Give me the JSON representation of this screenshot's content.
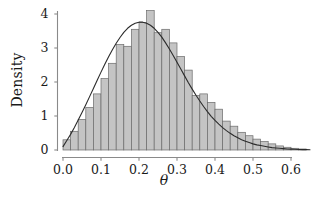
{
  "chart_data": {
    "type": "bar",
    "title": "",
    "subtitle": "",
    "xlabel": "θ",
    "ylabel": "Density",
    "xlim": [
      -0.012,
      0.66
    ],
    "ylim": [
      0,
      4.25
    ],
    "grid": false,
    "legend": null,
    "x_ticks": [
      0.0,
      0.1,
      0.2,
      0.3,
      0.4,
      0.5,
      0.6
    ],
    "x_tick_labels": [
      "0.0",
      "0.1",
      "0.2",
      "0.3",
      "0.4",
      "0.5",
      "0.6"
    ],
    "y_ticks": [
      0,
      1,
      2,
      3,
      4
    ],
    "y_tick_labels": [
      "0",
      "1",
      "2",
      "3",
      "4"
    ],
    "bin_width": 0.02,
    "bin_edges": [
      0.0,
      0.02,
      0.04,
      0.06,
      0.08,
      0.1,
      0.12,
      0.14,
      0.16,
      0.18,
      0.2,
      0.22,
      0.24,
      0.26,
      0.28,
      0.3,
      0.32,
      0.34,
      0.36,
      0.38,
      0.4,
      0.42,
      0.44,
      0.46,
      0.48,
      0.5,
      0.52,
      0.54,
      0.56,
      0.58,
      0.6,
      0.62,
      0.64
    ],
    "categories": [
      "0.00-0.02",
      "0.02-0.04",
      "0.04-0.06",
      "0.06-0.08",
      "0.08-0.10",
      "0.10-0.12",
      "0.12-0.14",
      "0.14-0.16",
      "0.16-0.18",
      "0.18-0.20",
      "0.20-0.22",
      "0.22-0.24",
      "0.24-0.26",
      "0.26-0.28",
      "0.28-0.30",
      "0.30-0.32",
      "0.32-0.34",
      "0.34-0.36",
      "0.36-0.38",
      "0.38-0.40",
      "0.40-0.42",
      "0.42-0.44",
      "0.44-0.46",
      "0.46-0.48",
      "0.48-0.50",
      "0.50-0.52",
      "0.52-0.54",
      "0.54-0.56",
      "0.56-0.58",
      "0.58-0.60",
      "0.60-0.62",
      "0.62-0.64"
    ],
    "values": [
      0.3,
      0.55,
      0.9,
      1.25,
      1.65,
      2.1,
      2.55,
      3.1,
      3.05,
      3.55,
      3.75,
      4.1,
      3.45,
      3.55,
      3.15,
      2.75,
      2.35,
      1.6,
      1.65,
      1.4,
      1.2,
      0.85,
      0.7,
      0.52,
      0.42,
      0.32,
      0.25,
      0.18,
      0.12,
      0.08,
      0.05,
      0.03
    ],
    "series": [
      {
        "name": "density-curve",
        "type": "line",
        "x": [
          0.0,
          0.01,
          0.02,
          0.03,
          0.04,
          0.05,
          0.06,
          0.07,
          0.08,
          0.09,
          0.1,
          0.11,
          0.12,
          0.13,
          0.14,
          0.15,
          0.16,
          0.17,
          0.18,
          0.19,
          0.2,
          0.21,
          0.22,
          0.23,
          0.24,
          0.25,
          0.26,
          0.27,
          0.28,
          0.29,
          0.3,
          0.31,
          0.32,
          0.33,
          0.34,
          0.35,
          0.36,
          0.37,
          0.38,
          0.39,
          0.4,
          0.41,
          0.42,
          0.43,
          0.44,
          0.45,
          0.46,
          0.47,
          0.48,
          0.49,
          0.5,
          0.51,
          0.52,
          0.53,
          0.54,
          0.55,
          0.56,
          0.57,
          0.58,
          0.59,
          0.6,
          0.61,
          0.62,
          0.63,
          0.64,
          0.65
        ],
        "y": [
          0.1,
          0.28,
          0.46,
          0.66,
          0.88,
          1.1,
          1.33,
          1.57,
          1.81,
          2.05,
          2.29,
          2.52,
          2.74,
          2.95,
          3.14,
          3.31,
          3.46,
          3.58,
          3.67,
          3.73,
          3.76,
          3.76,
          3.73,
          3.67,
          3.58,
          3.46,
          3.32,
          3.15,
          2.97,
          2.78,
          2.58,
          2.38,
          2.18,
          1.98,
          1.79,
          1.61,
          1.44,
          1.28,
          1.13,
          0.99,
          0.87,
          0.76,
          0.66,
          0.57,
          0.49,
          0.42,
          0.36,
          0.3,
          0.26,
          0.22,
          0.18,
          0.15,
          0.13,
          0.11,
          0.09,
          0.07,
          0.06,
          0.05,
          0.04,
          0.03,
          0.025,
          0.02,
          0.015,
          0.012,
          0.01,
          0.008
        ]
      }
    ],
    "colors": {
      "bar_fill": "#c4c4c4",
      "bar_edge": "#6b6b6b",
      "curve": "#2b2b2b",
      "axis": "#8a8a8a",
      "text": "#1a1a1a",
      "background": "#ffffff"
    }
  }
}
